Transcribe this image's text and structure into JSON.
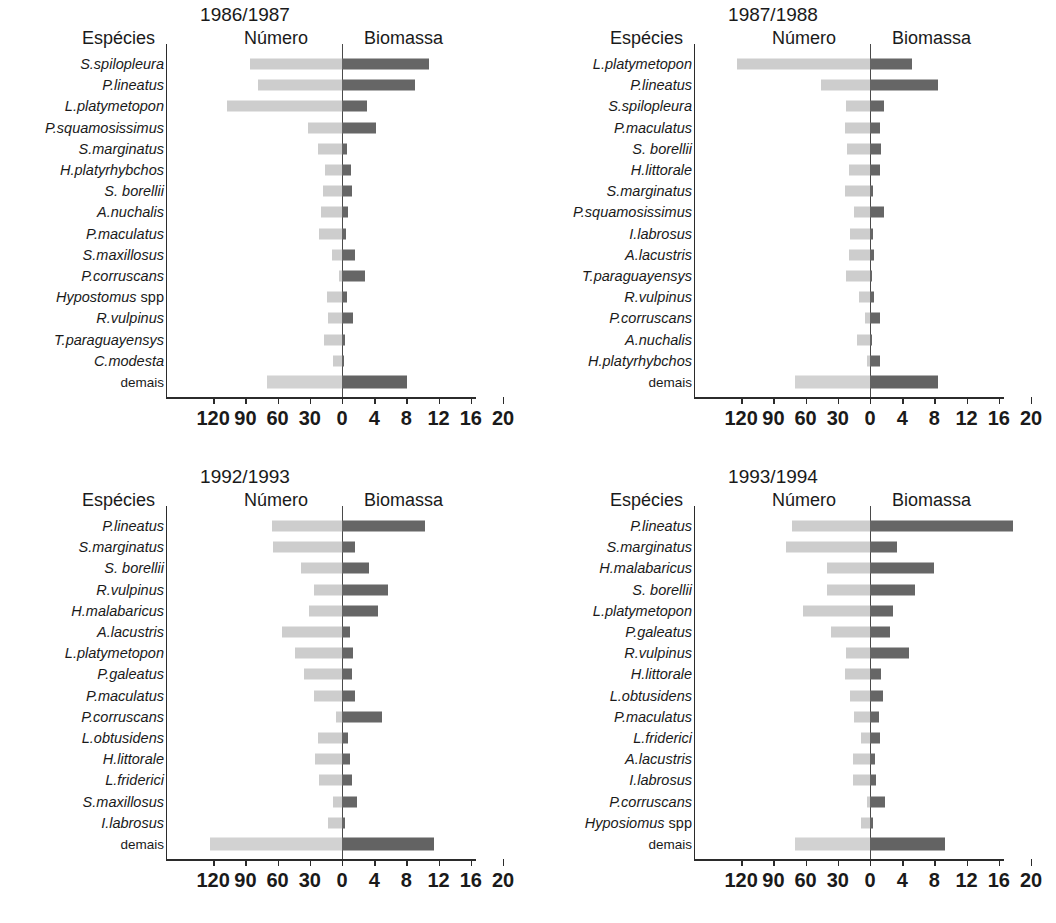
{
  "figure": {
    "colors": {
      "numero_bar": "#cdcdcd",
      "biomassa_bar": "#666666",
      "axis": "#2b2b2b",
      "background": "#ffffff",
      "text": "#1a1a1a"
    },
    "headers": {
      "especies": "Espécies",
      "numero": "Número",
      "biomassa": "Biomassa"
    },
    "axis": {
      "tick_labels": [
        "120",
        "90",
        "60",
        "30",
        "0",
        "4",
        "8",
        "12",
        "16",
        "20"
      ],
      "numero_scale_max": 140,
      "biomassa_scale_max": 20,
      "numero_ticks": [
        120,
        90,
        60,
        30,
        0
      ],
      "biomassa_ticks": [
        0,
        4,
        8,
        12,
        16,
        20
      ]
    },
    "demais_label": "demais"
  },
  "chart_data": [
    {
      "type": "bar",
      "title": "1986/1987",
      "xlabel": "",
      "ylabel": "Espécies",
      "legend": [
        "Número",
        "Biomassa"
      ],
      "categories": [
        "S.spilopleura",
        "P.lineatus",
        "L.platymetopon",
        "P.squamosissimus",
        "S.marginatus",
        "H.platyrhybchos",
        "S. borellii",
        "A.nuchalis",
        "P.maculatus",
        "S.maxillosus",
        "P.corruscans",
        "Hypostomus spp",
        "R.vulpinus",
        "T.paraguayensys",
        "C.modesta",
        "demais"
      ],
      "series": [
        {
          "name": "Número",
          "values": [
            86,
            78,
            107,
            32,
            22,
            16,
            18,
            20,
            21,
            9,
            3,
            14,
            13,
            17,
            8,
            70
          ]
        },
        {
          "name": "Biomassa",
          "values": [
            10.8,
            9.1,
            3.1,
            4.2,
            0.6,
            1.1,
            1.2,
            0.7,
            0.5,
            1.6,
            2.8,
            0.6,
            1.4,
            0.4,
            0.3,
            8.1
          ]
        }
      ]
    },
    {
      "type": "bar",
      "title": "1987/1988",
      "xlabel": "",
      "ylabel": "Espécies",
      "legend": [
        "Número",
        "Biomassa"
      ],
      "categories": [
        "L.platymetopon",
        "P.lineatus",
        "S.spilopleura",
        "P.maculatus",
        "S. borellii",
        "H.littorale",
        "S.marginatus",
        "P.squamosissimus",
        "I.labrosus",
        "A.lacustris",
        "T.paraguayensys",
        "R.vulpinus",
        "P.corruscans",
        "A.nuchalis",
        "H.platyrhybchos",
        "demais"
      ],
      "series": [
        {
          "name": "Número",
          "values": [
            124,
            46,
            22,
            23,
            21,
            20,
            23,
            15,
            19,
            20,
            22,
            10,
            5,
            12,
            3,
            70
          ]
        },
        {
          "name": "Biomassa",
          "values": [
            5.2,
            8.4,
            1.7,
            1.3,
            1.4,
            1.2,
            0.4,
            1.7,
            0.4,
            0.5,
            0.3,
            0.5,
            1.3,
            0.3,
            1.3,
            8.5
          ]
        }
      ]
    },
    {
      "type": "bar",
      "title": "1992/1993",
      "xlabel": "",
      "ylabel": "Espécies",
      "legend": [
        "Número",
        "Biomassa"
      ],
      "categories": [
        "P.lineatus",
        "S.marginatus",
        "S. borellii",
        "R.vulpinus",
        "H.malabaricus",
        "A.lacustris",
        "L.platymetopon",
        "P.galeatus",
        "P.maculatus",
        "P.corruscans",
        "L.obtusidens",
        "H.littorale",
        "L.friderici",
        "S.maxillosus",
        "I.labrosus",
        "demais"
      ],
      "series": [
        {
          "name": "Número",
          "values": [
            65,
            64,
            38,
            26,
            31,
            56,
            44,
            35,
            26,
            6,
            22,
            25,
            21,
            8,
            13,
            123
          ]
        },
        {
          "name": "Biomassa",
          "values": [
            10.3,
            1.6,
            3.3,
            5.7,
            4.5,
            1.0,
            1.4,
            1.3,
            1.6,
            5.0,
            0.7,
            1.0,
            1.2,
            1.9,
            0.4,
            11.4
          ]
        }
      ]
    },
    {
      "type": "bar",
      "title": "1993/1994",
      "xlabel": "",
      "ylabel": "Espécies",
      "legend": [
        "Número",
        "Biomassa"
      ],
      "categories": [
        "P.lineatus",
        "S.marginatus",
        "H.malabaricus",
        "S. borellii",
        "L.platymetopon",
        "P.galeatus",
        "R.vulpinus",
        "H.littorale",
        "L.obtusidens",
        "P.maculatus",
        "L.friderici",
        "A.lacustris",
        "I.labrosus",
        "P.corruscans",
        "Hyposiomus spp",
        "demais"
      ],
      "series": [
        {
          "name": "Número",
          "values": [
            73,
            78,
            40,
            40,
            62,
            36,
            22,
            23,
            19,
            15,
            8,
            16,
            16,
            3,
            8,
            70
          ]
        },
        {
          "name": "Biomassa",
          "values": [
            17.8,
            3.3,
            7.9,
            5.6,
            2.9,
            2.5,
            4.9,
            1.4,
            1.6,
            1.1,
            1.3,
            0.6,
            0.8,
            1.9,
            0.4,
            9.3
          ]
        }
      ]
    }
  ]
}
